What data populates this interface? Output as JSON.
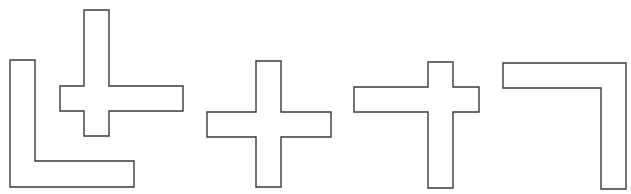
{
  "diagram": {
    "width": 631,
    "height": 194,
    "stroke_color": "#3a3a3a",
    "fill_color": "#ffffff",
    "shapes": [
      {
        "id": "l-shape",
        "label": "L-shaped polygon",
        "points": "10,60 35,60 35,161 134,161 134,187 10,187"
      },
      {
        "id": "cross-offset-1",
        "label": "Cross shape with long right arm",
        "points": "84,10 109,10 109,86 183,86 183,111 109,111 109,136 84,136 84,111 60,111 60,86 84,86"
      },
      {
        "id": "cross-symmetric",
        "label": "Symmetric plus shape",
        "points": "256,61 281,61 281,112 331,112 331,137 281,137 281,187 256,187 256,137 207,137 207,112 256,112"
      },
      {
        "id": "cross-offset-2",
        "label": "Cross shape with long left arm and long lower arm",
        "points": "428,62 453,62 453,87 479,87 479,112 453,112 453,188 428,188 428,112 354,112 354,87 428,87"
      },
      {
        "id": "corner-shape",
        "label": "Reversed L-shaped polygon",
        "points": "503,63 626,63 626,189 601,189 601,88 503,88"
      }
    ]
  }
}
